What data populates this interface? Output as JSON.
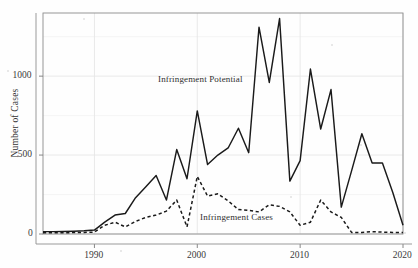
{
  "chart_data": {
    "type": "line",
    "title": "",
    "subtitle": "",
    "xlabel": "",
    "ylabel": "Number of Cases",
    "xlim": [
      1985,
      2020
    ],
    "ylim": [
      0,
      1400
    ],
    "xticks": [
      1990,
      2000,
      2010,
      2020
    ],
    "xticklabels": [
      "1990",
      "2000",
      "2010",
      "2020"
    ],
    "yticks": [
      0,
      500,
      1000
    ],
    "yticklabels": [
      "0",
      "500",
      "1000"
    ],
    "grid": true,
    "grid_color": "#e6e6e6",
    "legend_position": "inline-annotations",
    "x": [
      1985,
      1986,
      1987,
      1988,
      1989,
      1990,
      1991,
      1992,
      1993,
      1994,
      1995,
      1996,
      1997,
      1998,
      1999,
      2000,
      2001,
      2002,
      2003,
      2004,
      2005,
      2006,
      2007,
      2008,
      2009,
      2010,
      2011,
      2012,
      2013,
      2014,
      2015,
      2016,
      2017,
      2018,
      2019,
      2020
    ],
    "series": [
      {
        "name": "Infringement Potential",
        "style": "solid",
        "color": "#1a1a1a",
        "annotation": "Infringement Potential",
        "values": [
          15,
          15,
          16,
          18,
          20,
          25,
          75,
          120,
          130,
          230,
          300,
          370,
          215,
          535,
          350,
          780,
          440,
          500,
          545,
          670,
          515,
          1310,
          960,
          1365,
          335,
          465,
          1045,
          665,
          915,
          170,
          400,
          635,
          450,
          450,
          265,
          55
        ]
      },
      {
        "name": "Infringement Cases",
        "style": "dashed",
        "color": "#1a1a1a",
        "annotation": "Infringement Cases",
        "values": [
          8,
          8,
          8,
          9,
          10,
          12,
          55,
          75,
          45,
          80,
          105,
          120,
          145,
          215,
          45,
          365,
          240,
          255,
          210,
          155,
          150,
          140,
          185,
          175,
          140,
          55,
          75,
          215,
          140,
          105,
          10,
          10,
          15,
          12,
          10,
          10
        ]
      }
    ]
  },
  "annotations": {
    "potential_label": "Infringement Potential",
    "cases_label": "Infringement Cases"
  }
}
